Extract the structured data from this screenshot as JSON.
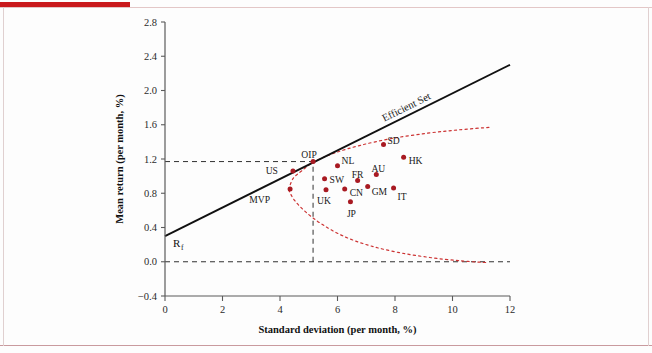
{
  "figure": {
    "background_color": "#fdfdfd",
    "accent_color": "#c9191c",
    "marker_color": "#a81a22",
    "frontier_color": "#cc3333",
    "line_color": "#111111"
  },
  "chart_data": {
    "type": "scatter",
    "title": "",
    "xlabel": "Standard deviation (per month, %)",
    "ylabel": "Mean return (per month, %)",
    "xlim": [
      0,
      12
    ],
    "ylim": [
      -0.4,
      2.8
    ],
    "xticks": [
      "0",
      "2",
      "4",
      "6",
      "8",
      "10",
      "12"
    ],
    "xtick_values": [
      0,
      2,
      4,
      6,
      8,
      10,
      12
    ],
    "yticks": [
      "-0.4",
      "0.0",
      "0.4",
      "0.8",
      "1.2",
      "1.6",
      "2.0",
      "2.4",
      "2.8"
    ],
    "ytick_values": [
      -0.4,
      0.0,
      0.4,
      0.8,
      1.2,
      1.6,
      2.0,
      2.4,
      2.8
    ],
    "grid": false,
    "legend": "none",
    "points": [
      {
        "label": "US",
        "x": 4.45,
        "y": 1.06,
        "label_dx": -15,
        "label_dy": 0
      },
      {
        "label": "MVP",
        "x": 4.35,
        "y": 0.85,
        "label_dx": -20,
        "label_dy": 11
      },
      {
        "label": "OIP",
        "x": 5.15,
        "y": 1.17,
        "label_dx": -4,
        "label_dy": -7
      },
      {
        "label": "SW",
        "x": 5.55,
        "y": 0.97,
        "label_dx": 5,
        "label_dy": 1
      },
      {
        "label": "UK",
        "x": 5.6,
        "y": 0.84,
        "label_dx": -2,
        "label_dy": 11
      },
      {
        "label": "NL",
        "x": 6.0,
        "y": 1.12,
        "label_dx": 4,
        "label_dy": -5
      },
      {
        "label": "CN",
        "x": 6.25,
        "y": 0.85,
        "label_dx": 5,
        "label_dy": 4
      },
      {
        "label": "JP",
        "x": 6.45,
        "y": 0.7,
        "label_dx": 1,
        "label_dy": 12
      },
      {
        "label": "FR",
        "x": 6.7,
        "y": 0.95,
        "label_dx": 0,
        "label_dy": -6
      },
      {
        "label": "GM",
        "x": 7.05,
        "y": 0.88,
        "label_dx": 4,
        "label_dy": 5
      },
      {
        "label": "AU",
        "x": 7.35,
        "y": 1.02,
        "label_dx": 2,
        "label_dy": -6
      },
      {
        "label": "SD",
        "x": 7.6,
        "y": 1.37,
        "label_dx": 4,
        "label_dy": -4
      },
      {
        "label": "IT",
        "x": 7.95,
        "y": 0.86,
        "label_dx": 4,
        "label_dy": 8
      },
      {
        "label": "HK",
        "x": 8.3,
        "y": 1.22,
        "label_dx": 5,
        "label_dy": 3
      }
    ],
    "cml": {
      "name": "Efficient Set",
      "intercept_label": "R",
      "intercept_sub": "f",
      "intercept_y": 0.3,
      "from": [
        0.0,
        0.3
      ],
      "to": [
        12.0,
        2.3
      ]
    },
    "frontier_upper": [
      [
        4.3,
        0.84
      ],
      [
        4.45,
        0.97
      ],
      [
        4.75,
        1.06
      ],
      [
        5.2,
        1.17
      ],
      [
        5.9,
        1.27
      ],
      [
        6.8,
        1.36
      ],
      [
        7.9,
        1.44
      ],
      [
        9.1,
        1.5
      ],
      [
        10.2,
        1.54
      ],
      [
        11.3,
        1.57
      ]
    ],
    "frontier_lower": [
      [
        4.3,
        0.84
      ],
      [
        4.5,
        0.72
      ],
      [
        4.9,
        0.58
      ],
      [
        5.45,
        0.44
      ],
      [
        6.2,
        0.3
      ],
      [
        7.1,
        0.19
      ],
      [
        8.1,
        0.11
      ],
      [
        9.2,
        0.05
      ],
      [
        10.3,
        0.01
      ],
      [
        11.2,
        -0.01
      ]
    ],
    "guide_lines": {
      "horizontal_at_y": 1.17,
      "horizontal_from_x": 0,
      "horizontal_to_x": 5.15,
      "vertical_at_x": 5.15,
      "vertical_from_y": 0.0,
      "vertical_to_y": 1.17,
      "baseline_y": 0.0,
      "baseline_from_x": 0,
      "baseline_to_x": 12
    }
  }
}
